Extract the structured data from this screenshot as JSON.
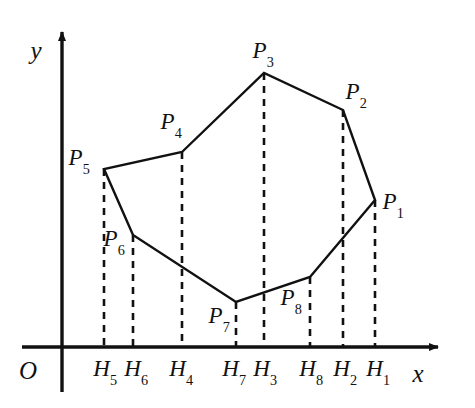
{
  "figure": {
    "type": "geometry-diagram",
    "colors": {
      "stroke": "#111111",
      "background": "#ffffff",
      "dash": "#111111"
    },
    "axes": {
      "origin_label": "O",
      "x_label": "x",
      "y_label": "y",
      "x_axis_y": 347,
      "y_axis_x": 62,
      "x_arrow_tip_x": 443,
      "y_arrow_tip_y": 26
    },
    "vertices": [
      {
        "name": "P1",
        "letter": "P",
        "sub": "1",
        "x": 375,
        "y": 200,
        "label_x": 393,
        "label_y": 203,
        "foot": "H1",
        "foot_x": 375,
        "foot_label_x": 378,
        "foot_label_y": 370
      },
      {
        "name": "P2",
        "letter": "P",
        "sub": "2",
        "x": 343,
        "y": 110,
        "label_x": 356,
        "label_y": 93,
        "foot": "H2",
        "foot_x": 343,
        "foot_label_x": 345,
        "foot_label_y": 370
      },
      {
        "name": "P3",
        "letter": "P",
        "sub": "3",
        "x": 264,
        "y": 73,
        "label_x": 263,
        "label_y": 52,
        "foot": "H3",
        "foot_x": 264,
        "foot_label_x": 265,
        "foot_label_y": 370
      },
      {
        "name": "P4",
        "letter": "P",
        "sub": "4",
        "x": 182,
        "y": 152,
        "label_x": 171,
        "label_y": 123,
        "foot": "H4",
        "foot_x": 182,
        "foot_label_x": 181,
        "foot_label_y": 370
      },
      {
        "name": "P5",
        "letter": "P",
        "sub": "5",
        "x": 104,
        "y": 169,
        "label_x": 79,
        "label_y": 159,
        "foot": "H5",
        "foot_x": 104,
        "foot_label_x": 105,
        "foot_label_y": 370
      },
      {
        "name": "P6",
        "letter": "P",
        "sub": "6",
        "x": 133,
        "y": 235,
        "label_x": 114,
        "label_y": 240,
        "foot": "H6",
        "foot_x": 133,
        "foot_label_x": 136,
        "foot_label_y": 370
      },
      {
        "name": "P7",
        "letter": "P",
        "sub": "7",
        "x": 236,
        "y": 302,
        "label_x": 219,
        "label_y": 317,
        "foot": "H7",
        "foot_x": 236,
        "foot_label_x": 234,
        "foot_label_y": 370
      },
      {
        "name": "P8",
        "letter": "P",
        "sub": "8",
        "x": 310,
        "y": 277,
        "label_x": 291,
        "label_y": 299,
        "foot": "H8",
        "foot_x": 310,
        "foot_label_x": 311,
        "foot_label_y": 370
      }
    ],
    "polygon_path": "375,200 343,110 264,73 182,152 104,169 133,235 236,302 310,277",
    "axis_labels": {
      "origin": {
        "text": "O",
        "x": 28,
        "y": 370
      },
      "x": {
        "text": "x",
        "x": 418,
        "y": 373
      },
      "y": {
        "text": "y",
        "x": 36,
        "y": 50
      }
    }
  }
}
